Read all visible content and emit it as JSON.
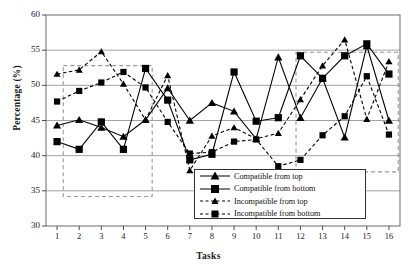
{
  "chart_data": {
    "type": "line",
    "title": "",
    "xlabel": "Tasks",
    "ylabel": "Percentage (%)",
    "xlim": [
      0.5,
      16.5
    ],
    "ylim": [
      30,
      60
    ],
    "ytick_labels": [
      "30",
      "35",
      "40",
      "45",
      "50",
      "55",
      "60"
    ],
    "ytick_values": [
      30,
      35,
      40,
      45,
      50,
      55,
      60
    ],
    "grid": "horizontal",
    "legend_position": "bottom-center",
    "categories": [
      1,
      2,
      3,
      4,
      5,
      6,
      7,
      8,
      9,
      10,
      11,
      12,
      13,
      14,
      15,
      16
    ],
    "xtick_labels": [
      "1",
      "2",
      "3",
      "4",
      "5",
      "6",
      "7",
      "8",
      "9",
      "10",
      "11",
      "12",
      "13",
      "14",
      "15",
      "16"
    ],
    "series": [
      {
        "name": "Compatible from top",
        "marker": "triangle",
        "line": "solid",
        "color": "#000000",
        "values": [
          44.3,
          45.1,
          44.0,
          42.7,
          45.1,
          49.6,
          45.0,
          47.5,
          46.3,
          42.4,
          54.0,
          45.4,
          51.0,
          42.6,
          55.6,
          45.0
        ]
      },
      {
        "name": "Compatible from bottom",
        "marker": "square",
        "line": "solid",
        "color": "#000000",
        "values": [
          42.0,
          40.9,
          44.8,
          40.9,
          52.4,
          47.9,
          39.4,
          40.2,
          51.9,
          44.9,
          45.4,
          54.2,
          51.0,
          54.2,
          55.9,
          51.6
        ]
      },
      {
        "name": "Incompatible from top",
        "marker": "triangle",
        "line": "dashed",
        "color": "#000000",
        "values": [
          51.6,
          52.2,
          54.8,
          50.2,
          45.1,
          51.4,
          37.9,
          42.8,
          44.0,
          42.4,
          43.2,
          48.0,
          52.8,
          56.5,
          45.2,
          53.4
        ]
      },
      {
        "name": "Incompatible from bottom",
        "marker": "square",
        "line": "dashed",
        "color": "#000000",
        "values": [
          47.7,
          49.2,
          50.4,
          51.9,
          49.7,
          44.8,
          40.3,
          40.5,
          42.0,
          42.3,
          38.5,
          39.4,
          42.9,
          45.6,
          51.3,
          43.0
        ]
      }
    ],
    "annotations": [
      {
        "type": "dashed-rect",
        "x0": 1.28,
        "x1": 5.3,
        "y0": 34.2,
        "y1": 52.8,
        "color": "#999999"
      },
      {
        "type": "dashed-rect",
        "x0": 11.8,
        "x1": 16.42,
        "y0": 37.7,
        "y1": 54.7,
        "color": "#999999"
      }
    ]
  },
  "legend": {
    "items": [
      {
        "label": "Compatible from top"
      },
      {
        "label": "Compatible from bottom"
      },
      {
        "label": "Incompatible from top"
      },
      {
        "label": "Incompatible from bottom"
      }
    ]
  }
}
